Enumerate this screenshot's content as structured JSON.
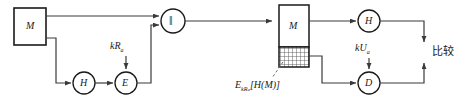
{
  "diagram": {
    "colors": {
      "line": "#3a3a3a",
      "box_border": "#1a1a1a",
      "hatch": "#4a4a4a",
      "text": "#1a1a1a",
      "background": "#ffffff"
    },
    "nodes": {
      "source_message_box": {
        "label": "M"
      },
      "hash_sender": {
        "label": "H"
      },
      "encrypt": {
        "label": "E"
      },
      "concat": {
        "label": "‖"
      },
      "received_message_box": {
        "label": "M"
      },
      "hash_receiver": {
        "label": "H"
      },
      "decrypt": {
        "label": "D"
      }
    },
    "labels": {
      "private_key": {
        "main": "kR",
        "sub": "a"
      },
      "public_key": {
        "main": "kU",
        "sub": "a"
      },
      "signature_block": {
        "e": "E",
        "e_sub": "kR",
        "e_sub2": "a",
        "bracket": "[H(M)]"
      },
      "compare": "比较"
    }
  }
}
